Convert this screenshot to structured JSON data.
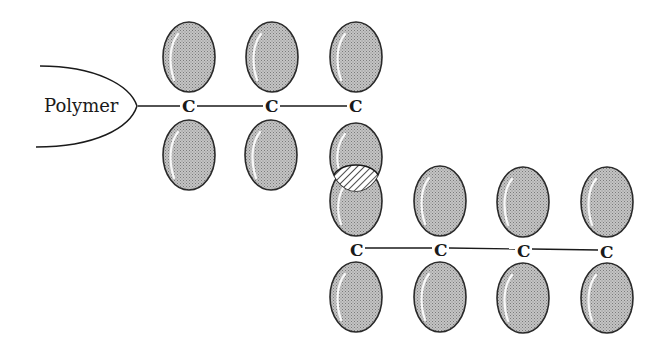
{
  "diagram": {
    "type": "molecular-orbital-schematic",
    "polymer_label": "Polymer",
    "atom_label": "C",
    "colors": {
      "orbital_fill": "#b8b8b8",
      "orbital_stroke": "#2a2a2a",
      "line": "#1a1a1a",
      "background": "#ffffff"
    },
    "chains": [
      {
        "name": "upper-chain",
        "atoms": [
          {
            "label": "C",
            "x": 188,
            "y": 106
          },
          {
            "label": "C",
            "x": 271,
            "y": 106
          },
          {
            "label": "C",
            "x": 355,
            "y": 106
          }
        ]
      },
      {
        "name": "lower-chain",
        "atoms": [
          {
            "label": "C",
            "x": 356,
            "y": 250
          },
          {
            "label": "C",
            "x": 440,
            "y": 250
          },
          {
            "label": "C",
            "x": 523,
            "y": 250
          },
          {
            "label": "C",
            "x": 606,
            "y": 250
          }
        ]
      }
    ],
    "overlap_region": {
      "description": "hatched orbital overlap between upper and lower chains",
      "cx": 356,
      "cy": 178
    }
  }
}
